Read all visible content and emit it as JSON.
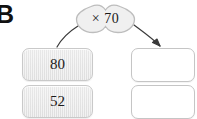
{
  "problem": {
    "label": "B"
  },
  "rule": {
    "icon": "cloud-shape",
    "operation_symbol": "×",
    "operand": "70",
    "text": "× 70"
  },
  "arrows": [
    {
      "name": "arrow-rule-to-input",
      "direction": "down-left",
      "has_arrowhead": false
    },
    {
      "name": "arrow-rule-to-output",
      "direction": "down-right",
      "has_arrowhead": true
    }
  ],
  "inputs": {
    "column_role": "input",
    "boxes": [
      {
        "value": "80",
        "filled": true
      },
      {
        "value": "52",
        "filled": true
      }
    ]
  },
  "outputs": {
    "column_role": "output",
    "boxes": [
      {
        "value": "",
        "filled": false
      },
      {
        "value": "",
        "filled": false
      }
    ]
  },
  "colors": {
    "page_background": "#ffffff",
    "input_box_fill": "#e8e8e8",
    "input_box_border": "#c9c9c9",
    "output_box_fill": "#ffffff",
    "output_box_border": "#c5c5c5",
    "cloud_fill": "#f0f0f0",
    "cloud_border": "#bdbdbd",
    "text": "#1a1a1a",
    "arrow": "#3a3a3a"
  }
}
